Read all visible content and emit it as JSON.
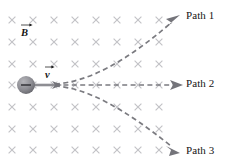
{
  "figure": {
    "background_color": "#ffffff"
  },
  "field_region": {
    "symbol": "field-into-page-x",
    "marker_glyph": "×",
    "color": "#c2c2c6",
    "columns": 8,
    "rows": 7,
    "x_positions": [
      12,
      33,
      54,
      75,
      96,
      117,
      138,
      159
    ],
    "y_positions": [
      20,
      42,
      64,
      85,
      107,
      129,
      150
    ]
  },
  "particle": {
    "name": "charged-particle",
    "charge_sign": "−",
    "fill_color": "#8a8a8f",
    "center_x": 26,
    "center_y": 85,
    "radius": 9
  },
  "vectors": {
    "magnetic_field": {
      "label": "B",
      "notation": "vector",
      "color": "#151515"
    },
    "velocity": {
      "label": "v",
      "notation": "vector",
      "color": "#151515",
      "direction": "right",
      "shaft_color": "#8e8e93"
    }
  },
  "paths": [
    {
      "id": "path-1",
      "label": "Path 1",
      "curvature": "upward",
      "color": "#7b7b80",
      "style": "dashed",
      "start": [
        55,
        84
      ],
      "end": [
        178,
        17
      ]
    },
    {
      "id": "path-2",
      "label": "Path 2",
      "curvature": "straight",
      "color": "#7b7b80",
      "style": "dashed",
      "start": [
        55,
        85
      ],
      "end": [
        181,
        85
      ]
    },
    {
      "id": "path-3",
      "label": "Path 3",
      "curvature": "downward",
      "color": "#7b7b80",
      "style": "dashed",
      "start": [
        55,
        86
      ],
      "end": [
        178,
        152
      ]
    }
  ]
}
